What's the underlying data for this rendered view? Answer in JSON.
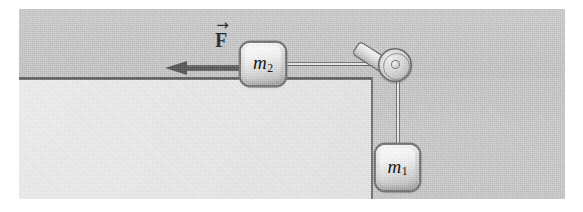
{
  "scene": {
    "wall_label": "background-wall",
    "table_surface_label": "table-surface",
    "table_face_label": "table-front-face",
    "table_edge_label": "table-right-edge",
    "colors": {
      "background": "#c9c9c9",
      "wall": "#c7c7c7",
      "table_face": "#ebebeb",
      "table_line": "#4e4e4e",
      "cord": "#656565",
      "arrow": "#4f4f4f",
      "block_fill": "#f0f0f0",
      "block_border": "#707070",
      "label_text": "#161616"
    }
  },
  "force": {
    "label_arrow": "→",
    "label_letter": "F",
    "direction": "left",
    "arrow_name": "force-vector-arrow"
  },
  "blocks": [
    {
      "id": "m2",
      "symbol": "m",
      "subscript": "2",
      "position": "on-table",
      "name": "mass-block-m2"
    },
    {
      "id": "m1",
      "symbol": "m",
      "subscript": "1",
      "position": "hanging",
      "name": "mass-block-m1"
    }
  ],
  "pulley": {
    "name": "pulley",
    "wheel_label": "pulley-wheel",
    "hub_label": "pulley-axle",
    "bracket_label": "pulley-bracket"
  },
  "cords": {
    "horizontal_label": "cord-m2-to-pulley",
    "vertical_label": "cord-pulley-to-m1"
  }
}
